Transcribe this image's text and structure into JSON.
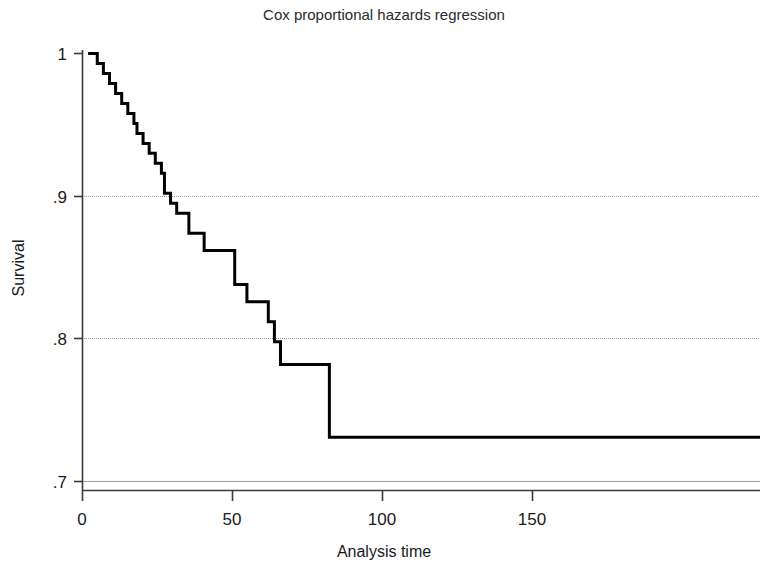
{
  "chart_data": {
    "type": "line",
    "subtype": "step-survival-curve",
    "title": "Cox proportional hazards regression",
    "xlabel": "Analysis time",
    "ylabel": "Survival",
    "xlim": [
      0,
      222
    ],
    "ylim": [
      0.7,
      1.0
    ],
    "xticks": [
      0,
      50,
      100,
      150
    ],
    "xtick_labels": [
      "0",
      "50",
      "100",
      "150"
    ],
    "yticks": [
      0.7,
      0.8,
      0.9,
      1.0
    ],
    "ytick_labels": [
      ".7",
      ".8",
      ".9",
      "1"
    ],
    "grid": "horizontal-only",
    "gridlines_at": [
      0.7,
      0.8,
      0.9
    ],
    "legend": "none",
    "line_color": "#000000",
    "line_width_px": 3,
    "grid_color": "#9a9a9a",
    "axis_color": "#333333",
    "background": "#ffffff",
    "series": [
      {
        "name": "Survival",
        "step": "post",
        "x": [
          2,
          5,
          7,
          9,
          11,
          13,
          15,
          17,
          18,
          20,
          22,
          24,
          26,
          27,
          29,
          31,
          35,
          40,
          44,
          47,
          50,
          54,
          57,
          61,
          63,
          65,
          79,
          81,
          222
        ],
        "y": [
          1.0,
          0.993,
          0.986,
          0.979,
          0.972,
          0.965,
          0.958,
          0.951,
          0.944,
          0.937,
          0.93,
          0.923,
          0.916,
          0.902,
          0.895,
          0.888,
          0.874,
          0.862,
          0.862,
          0.862,
          0.838,
          0.826,
          0.826,
          0.812,
          0.798,
          0.782,
          0.782,
          0.731,
          0.731
        ]
      }
    ],
    "annotations": [
      {
        "text": "curve crosses .9 near analysis time 26"
      },
      {
        "text": "curve crosses .8 near analysis time 61"
      },
      {
        "text": "plateau at .731 from analysis time 81 onward"
      }
    ]
  },
  "figure": {
    "title": "Cox proportional hazards regression",
    "x_axis_label": "Analysis time",
    "y_axis_label": "Survival"
  }
}
